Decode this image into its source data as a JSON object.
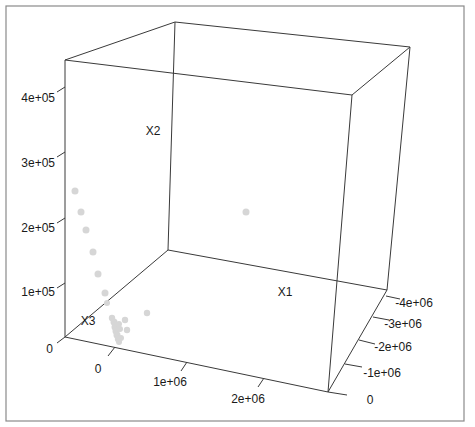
{
  "chart_data": {
    "type": "scatter",
    "subtype": "scatter3d",
    "title": "",
    "axes": {
      "x": {
        "label": "X1",
        "ticks": [
          "0",
          "1e+06",
          "2e+06"
        ],
        "range": [
          0,
          2500000
        ]
      },
      "y": {
        "label": "X2",
        "ticks": [
          "0",
          "1e+05",
          "2e+05",
          "3e+05",
          "4e+05"
        ],
        "range": [
          0,
          450000
        ]
      },
      "z": {
        "label": "X3",
        "ticks": [
          "0",
          "-1e+06",
          "-2e+06",
          "-3e+06",
          "-4e+06"
        ],
        "range": [
          0,
          -4200000
        ]
      }
    },
    "vertical_axis_label": "X2",
    "horizontal_axis_label": "X1",
    "depth_axis_label": "X3",
    "vertical_ticks": [
      {
        "label": "0",
        "y": 337
      },
      {
        "label": "1e+05",
        "y": 283
      },
      {
        "label": "2e+05",
        "y": 218
      },
      {
        "label": "3e+05",
        "y": 152
      },
      {
        "label": "4e+05",
        "y": 87
      }
    ],
    "horizontal_ticks": [
      {
        "label": "0",
        "x": 113,
        "y": 352
      },
      {
        "label": "1e+06",
        "x": 185,
        "y": 364
      },
      {
        "label": "2e+06",
        "x": 262,
        "y": 380
      }
    ],
    "depth_ticks": [
      {
        "label": "0",
        "x": 330,
        "y": 392
      },
      {
        "label": "-1e+06",
        "x": 345,
        "y": 364
      },
      {
        "label": "-2e+06",
        "x": 359,
        "y": 340
      },
      {
        "label": "-3e+06",
        "x": 373,
        "y": 317
      },
      {
        "label": "-4e+06",
        "x": 386,
        "y": 296
      }
    ],
    "points_approx_values": [
      {
        "X1": 0,
        "X2": 280000,
        "X3": -200000
      },
      {
        "X1": 0,
        "X2": 240000,
        "X3": -300000
      },
      {
        "X1": 0,
        "X2": 205000,
        "X3": -400000
      },
      {
        "X1": 0,
        "X2": 165000,
        "X3": -500000
      },
      {
        "X1": 0,
        "X2": 125000,
        "X3": -650000
      },
      {
        "X1": 0,
        "X2": 90000,
        "X3": -750000
      },
      {
        "X1": 0,
        "X2": 70000,
        "X3": -800000
      },
      {
        "X1": 50000,
        "X2": 40000,
        "X3": -600000
      },
      {
        "X1": 70000,
        "X2": 25000,
        "X3": -700000
      },
      {
        "X1": 100000,
        "X2": 10000,
        "X3": -600000
      },
      {
        "X1": 150000,
        "X2": 35000,
        "X3": -900000
      },
      {
        "X1": 180000,
        "X2": 20000,
        "X3": -900000
      },
      {
        "X1": 300000,
        "X2": 50000,
        "X3": -1500000
      },
      {
        "X1": 400000,
        "X2": 250000,
        "X3": -3900000
      }
    ],
    "grid": false,
    "legend": null,
    "point_color": "#d6d6d6",
    "box_color": "#3a3a3a"
  },
  "render": {
    "points_px": [
      [
        75,
        191,
        3.5
      ],
      [
        81,
        212,
        3.5
      ],
      [
        86,
        230,
        3.5
      ],
      [
        93,
        252,
        3.5
      ],
      [
        98,
        274,
        3.5
      ],
      [
        105,
        293,
        3.5
      ],
      [
        107,
        303,
        3
      ],
      [
        112,
        318,
        3.2
      ],
      [
        114,
        322,
        3.5
      ],
      [
        115,
        327,
        3.5
      ],
      [
        116,
        331,
        3.5
      ],
      [
        117,
        335,
        3.5
      ],
      [
        118,
        339,
        3.2
      ],
      [
        119,
        342,
        3
      ],
      [
        121,
        338,
        3
      ],
      [
        120,
        329,
        3
      ],
      [
        119,
        324,
        3
      ],
      [
        125,
        320,
        3.2
      ],
      [
        127,
        330,
        3.2
      ],
      [
        147,
        313,
        3.2
      ],
      [
        246,
        212,
        3.5
      ]
    ]
  }
}
